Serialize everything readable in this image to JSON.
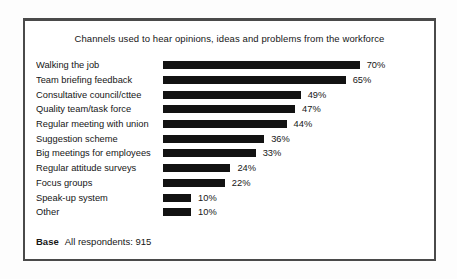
{
  "page": {
    "background": "#fdfdfd"
  },
  "chart_data": {
    "type": "bar",
    "orientation": "horizontal",
    "title": "Channels used to hear opinions, ideas and problems from the workforce",
    "categories": [
      "Walking the job",
      "Team briefing feedback",
      "Consultative council/cttee",
      "Quality team/task force",
      "Regular meeting with union",
      "Suggestion scheme",
      "Big meetings for employees",
      "Regular attitude surveys",
      "Focus groups",
      "Speak-up system",
      "Other"
    ],
    "values": [
      70,
      65,
      49,
      47,
      44,
      36,
      33,
      24,
      22,
      10,
      10
    ],
    "unit": "%",
    "xlim": [
      0,
      100
    ],
    "grid": false,
    "legend": "none",
    "value_labels_shown": true,
    "bar_color": "#121212"
  },
  "footer": {
    "base_label": "Base",
    "base_text": "All respondents: 915"
  },
  "colors": {
    "bar": "#121212",
    "text": "#161616",
    "frame_border": "#4a4a4a",
    "background": "#ffffff"
  }
}
